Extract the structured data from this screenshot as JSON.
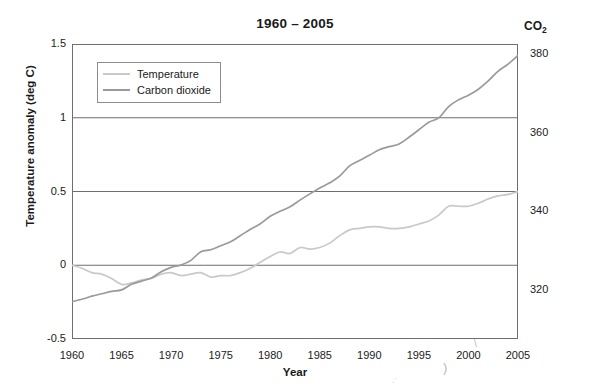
{
  "chart_data": {
    "type": "line",
    "title": "1960 – 2005",
    "xlabel": "Year",
    "ylabel": "Temperature anomaly (deg C)",
    "y2label": "CO2",
    "y2label_base": "CO",
    "y2label_sub": "2",
    "grid": "horizontal gridlines at 0, 0.5, 1.0 on left axis",
    "legend_position": "upper left inside axes",
    "xlim": [
      1960,
      2005
    ],
    "ylim": [
      -0.5,
      1.5
    ],
    "y2lim": [
      307.5,
      382.5
    ],
    "xticks": [
      1960,
      1965,
      1970,
      1975,
      1980,
      1985,
      1990,
      1995,
      2000,
      2005
    ],
    "xtick_labels": [
      "1960",
      "1965",
      "1970",
      "1975",
      "1980",
      "1985",
      "1990",
      "1995",
      "2000",
      "2005"
    ],
    "xminor_step": 1,
    "yticks": [
      -0.5,
      0,
      0.5,
      1,
      1.5
    ],
    "ytick_labels": [
      "-0.5",
      "0",
      "0.5",
      "1",
      "1.5"
    ],
    "yminor_step": 0.1,
    "y2ticks": [
      320,
      340,
      360,
      380
    ],
    "y2tick_labels": [
      "320",
      "340",
      "360",
      "380"
    ],
    "y2minor_step": 5,
    "series": [
      {
        "name": "Temperature",
        "label": "Temperature",
        "color": "#c9c9c9",
        "axis": "left",
        "units": "deg C",
        "x": [
          1960,
          1961,
          1962,
          1963,
          1964,
          1965,
          1966,
          1967,
          1968,
          1969,
          1970,
          1971,
          1972,
          1973,
          1974,
          1975,
          1976,
          1977,
          1978,
          1979,
          1980,
          1981,
          1982,
          1983,
          1984,
          1985,
          1986,
          1987,
          1988,
          1989,
          1990,
          1991,
          1992,
          1993,
          1994,
          1995,
          1996,
          1997,
          1998,
          1999,
          2000,
          2001,
          2002,
          2003,
          2004,
          2005
        ],
        "values": [
          0.0,
          -0.02,
          -0.05,
          -0.06,
          -0.09,
          -0.13,
          -0.12,
          -0.1,
          -0.09,
          -0.06,
          -0.05,
          -0.07,
          -0.06,
          -0.05,
          -0.08,
          -0.07,
          -0.07,
          -0.05,
          -0.02,
          0.02,
          0.06,
          0.09,
          0.08,
          0.12,
          0.11,
          0.12,
          0.15,
          0.2,
          0.24,
          0.25,
          0.26,
          0.26,
          0.25,
          0.25,
          0.26,
          0.28,
          0.3,
          0.34,
          0.4,
          0.4,
          0.4,
          0.42,
          0.45,
          0.47,
          0.48,
          0.5
        ]
      },
      {
        "name": "Carbon dioxide",
        "label": "Carbon dioxide",
        "color": "#9a9a9a",
        "axis": "right",
        "units": "ppm",
        "x": [
          1960,
          1961,
          1962,
          1963,
          1964,
          1965,
          1966,
          1967,
          1968,
          1969,
          1970,
          1971,
          1972,
          1973,
          1974,
          1975,
          1976,
          1977,
          1978,
          1979,
          1980,
          1981,
          1982,
          1983,
          1984,
          1985,
          1986,
          1987,
          1988,
          1989,
          1990,
          1991,
          1992,
          1993,
          1994,
          1995,
          1996,
          1997,
          1998,
          1999,
          2000,
          2001,
          2002,
          2003,
          2004,
          2005
        ],
        "values_ppm": [
          317.0,
          317.6,
          318.4,
          319.0,
          319.6,
          320.0,
          321.4,
          322.2,
          323.0,
          324.6,
          325.7,
          326.3,
          327.5,
          329.7,
          330.2,
          331.2,
          332.2,
          333.8,
          335.4,
          336.8,
          338.7,
          340.0,
          341.1,
          342.8,
          344.4,
          345.9,
          347.2,
          348.9,
          351.5,
          352.9,
          354.2,
          355.6,
          356.4,
          357.1,
          358.8,
          360.7,
          362.6,
          363.7,
          366.6,
          368.3,
          369.5,
          371.0,
          373.1,
          375.6,
          377.4,
          379.6
        ]
      }
    ]
  },
  "legend": {
    "items": [
      {
        "label": "Temperature",
        "color": "#c9c9c9"
      },
      {
        "label": "Carbon dioxide",
        "color": "#9a9a9a"
      }
    ]
  },
  "axes": {
    "title": "1960 – 2005",
    "xlabel": "Year",
    "ylabel_left": "Temperature anomaly (deg C)",
    "ylabel_right_base": "CO",
    "ylabel_right_sub": "2"
  },
  "colors": {
    "temperature": "#c9c9c9",
    "carbon_dioxide": "#9a9a9a",
    "gridline": "#6e6e6e",
    "frame": "#6e6e6e",
    "text": "#1a1a1a",
    "background": "#ffffff"
  }
}
